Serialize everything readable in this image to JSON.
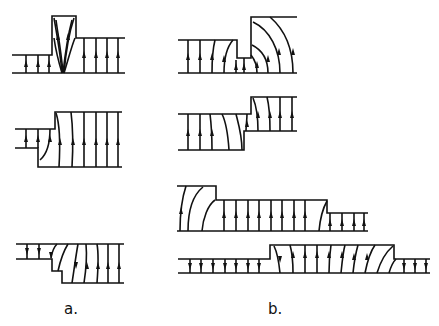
{
  "figure": {
    "panels": [
      {
        "id": "a",
        "label": "a.",
        "subfigures": [
          {
            "name": "narrow-gap-protrusion",
            "arrows": "up"
          },
          {
            "name": "step-outward",
            "arrows": "up"
          },
          {
            "name": "double-step",
            "arrows": "mixed"
          }
        ]
      },
      {
        "id": "b",
        "label": "b.",
        "subfigures": [
          {
            "name": "slot-between-plates",
            "arrows": "up"
          },
          {
            "name": "offset-step",
            "arrows": "up"
          },
          {
            "name": "stepped-ridge",
            "arrows": "up"
          },
          {
            "name": "raised-plateau",
            "arrows": "mixed"
          }
        ]
      }
    ],
    "line_color": "#111111",
    "background_color": "#ffffff"
  }
}
